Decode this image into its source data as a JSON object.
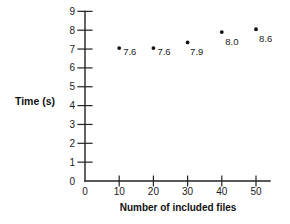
{
  "chart_data": {
    "type": "scatter",
    "title": "",
    "xlabel": "Number of included files",
    "ylabel": "Time (s)",
    "x": [
      10,
      20,
      30,
      40,
      50
    ],
    "values": [
      7.6,
      7.6,
      7.9,
      8.0,
      8.6
    ],
    "point_labels": [
      "7.6",
      "7.6",
      "7.9",
      "8.0",
      "8.6"
    ],
    "x_ticks": [
      "0",
      "10",
      "20",
      "30",
      "40",
      "50"
    ],
    "x_tick_values": [
      0,
      10,
      20,
      30,
      40,
      50
    ],
    "y_ticks": [
      "0",
      "1",
      "2",
      "3",
      "4",
      "5",
      "6",
      "7",
      "8",
      "9"
    ],
    "y_tick_values": [
      0,
      1,
      2,
      3,
      4,
      5,
      6,
      7,
      8,
      9
    ],
    "xlim": [
      0,
      54
    ],
    "ylim": [
      0,
      9
    ],
    "grid": false,
    "legend": "none",
    "marker_color": "#111111",
    "axis_color": "#222222",
    "text_color": "#1a1a1a",
    "background_color": "#ffffff",
    "plotted_y": [
      7.05,
      7.05,
      7.35,
      7.9,
      8.05
    ]
  }
}
